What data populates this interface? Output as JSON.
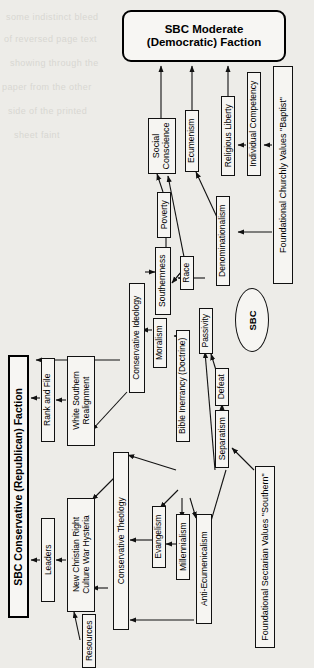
{
  "diagram": {
    "title_top": "SBC Moderate\n(Democratic) Faction",
    "title_top_line1": "SBC Moderate",
    "title_top_line2": "(Democratic) Faction",
    "title_left": "SBC Conservative (Republican) Faction",
    "center_node": "SBC"
  },
  "nodes": {
    "moderate_faction": "SBC Moderate (Democratic) Faction",
    "conservative_faction": "SBC Conservative (Republican) Faction",
    "sbc": "SBC",
    "social_conscience": "Social Conscience",
    "social_conscience_l1": "Social",
    "social_conscience_l2": "Conscience",
    "ecumenism": "Ecumenism",
    "religious_liberty": "Religious Liberty",
    "individual_competency": "Individual Competency",
    "foundational_churchly": "Foundational Churchly Values \"Baptist\"",
    "poverty": "Poverty",
    "race": "Race",
    "denominationalism": "Denominationalism",
    "southernness": "Southernness",
    "moralism": "Moralism",
    "conservative_ideology": "Conservative Ideology",
    "bible_inerrancy": "Bible Inerrancy (Doctrine)",
    "passivity": "Passivity",
    "defeat": "Defeat",
    "separatism": "Separatism",
    "foundational_sectarian": "Foundational Sectarian Values \"Southern\"",
    "conservative_theology": "Conservative Theology",
    "evangelism": "Evangelism",
    "millennialism": "Millennialism",
    "anti_ecumenicalism": "Anti-Ecumenicalism",
    "rank_and_file": "Rank and File",
    "leaders": "Leaders",
    "white_southern_realignment": "White Southern Realignment",
    "white_southern_l1": "White Southern",
    "white_southern_l2": "Realignment",
    "new_christian_right": "New Christian Right Culture War Hysteria",
    "new_christian_right_l1": "New Christian Right",
    "new_christian_right_l2": "Culture War Hysteria",
    "resources": "Resources"
  },
  "colors": {
    "background": "#edece8",
    "node_fill": "#f6f5f2",
    "stroke": "#111111",
    "ghost_text": "#d8d7d2"
  },
  "ghost_text": [
    "some indistinct bleed",
    "of reversed page text",
    "showing through the",
    "paper from the other",
    "side of the printed",
    "sheet  faint"
  ]
}
